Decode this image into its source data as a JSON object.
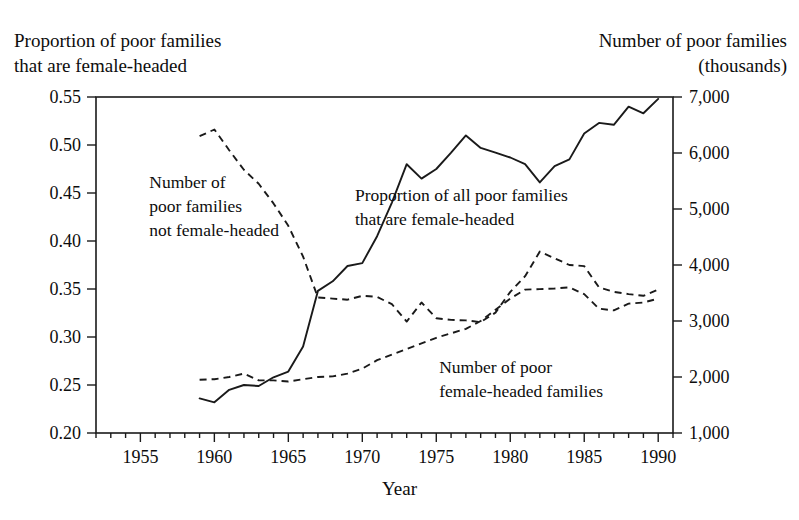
{
  "chart_data": {
    "type": "line",
    "title": "",
    "xlabel": "Year",
    "left_axis": {
      "label": "Proportion of poor families\nthat are female-headed",
      "ticks": [
        "0.55",
        "0.50",
        "0.45",
        "0.40",
        "0.35",
        "0.30",
        "0.25",
        "0.20"
      ],
      "values": [
        0.55,
        0.5,
        0.45,
        0.4,
        0.35,
        0.3,
        0.25,
        0.2
      ],
      "range": [
        0.2,
        0.55
      ]
    },
    "right_axis": {
      "label": "Number of poor families\n(thousands)",
      "ticks": [
        "7,000",
        "6,000",
        "5,000",
        "4,000",
        "3,000",
        "2,000",
        "1,000"
      ],
      "values": [
        7000,
        6000,
        5000,
        4000,
        3000,
        2000,
        1000
      ],
      "range": [
        1000,
        7000
      ]
    },
    "x_axis": {
      "tick_labels": [
        "1955",
        "1960",
        "1965",
        "1970",
        "1975",
        "1980",
        "1985",
        "1990"
      ],
      "tick_values": [
        1955,
        1960,
        1965,
        1970,
        1975,
        1980,
        1985,
        1990
      ],
      "range": [
        1952,
        1991
      ],
      "minor_tick_step": 1
    },
    "grid": false,
    "legend_position": "inline-annotations",
    "annotations": [
      {
        "name": "not-female-headed",
        "text": "Number of\npoor families\nnot female-headed",
        "x": 1955.6,
        "y_left": 0.455
      },
      {
        "name": "proportion-female-headed",
        "text": "Proportion of all poor families\nthat are female-headed",
        "x": 1969.5,
        "y_left": 0.442
      },
      {
        "name": "poor-female-headed-families",
        "text": "Number of poor\nfemale-headed families",
        "x": 1975.2,
        "y_left": 0.263
      }
    ],
    "series": [
      {
        "name": "Proportion of all poor families that are female-headed",
        "axis": "left",
        "style": "solid",
        "x": [
          1959,
          1960,
          1961,
          1962,
          1963,
          1964,
          1965,
          1966,
          1967,
          1968,
          1969,
          1970,
          1971,
          1972,
          1973,
          1974,
          1975,
          1976,
          1977,
          1978,
          1979,
          1980,
          1981,
          1982,
          1983,
          1984,
          1985,
          1986,
          1987,
          1988,
          1989,
          1990
        ],
        "values": [
          0.236,
          0.232,
          0.245,
          0.25,
          0.249,
          0.258,
          0.264,
          0.29,
          0.348,
          0.358,
          0.374,
          0.377,
          0.405,
          0.44,
          0.48,
          0.465,
          0.475,
          0.492,
          0.51,
          0.497,
          0.492,
          0.487,
          0.48,
          0.461,
          0.478,
          0.485,
          0.512,
          0.523,
          0.521,
          0.54,
          0.533,
          0.548
        ]
      },
      {
        "name": "Number of poor families not female-headed",
        "axis": "right",
        "style": "dashed",
        "x": [
          1959,
          1960,
          1961,
          1962,
          1963,
          1964,
          1965,
          1966,
          1967,
          1968,
          1969,
          1970,
          1971,
          1972,
          1973,
          1974,
          1975,
          1976,
          1977,
          1978,
          1979,
          1980,
          1981,
          1982,
          1983,
          1984,
          1985,
          1986,
          1987,
          1988,
          1989,
          1990
        ],
        "values": [
          6300,
          6420,
          6050,
          5700,
          5450,
          5100,
          4700,
          4150,
          3420,
          3400,
          3380,
          3450,
          3430,
          3300,
          2990,
          3330,
          3050,
          3020,
          3010,
          2980,
          3150,
          3520,
          3800,
          4240,
          4120,
          4000,
          3980,
          3600,
          3520,
          3480,
          3450,
          3560
        ]
      },
      {
        "name": "Number of poor female-headed families",
        "axis": "right",
        "style": "dashed",
        "x": [
          1959,
          1960,
          1961,
          1962,
          1963,
          1964,
          1965,
          1966,
          1967,
          1968,
          1969,
          1970,
          1971,
          1972,
          1973,
          1974,
          1975,
          1976,
          1977,
          1978,
          1979,
          1980,
          1981,
          1982,
          1983,
          1984,
          1985,
          1986,
          1987,
          1988,
          1989,
          1990
        ],
        "values": [
          1950,
          1960,
          2000,
          2060,
          1940,
          1940,
          1920,
          1960,
          2000,
          2010,
          2060,
          2150,
          2300,
          2400,
          2500,
          2600,
          2700,
          2780,
          2860,
          3000,
          3200,
          3400,
          3560,
          3570,
          3580,
          3600,
          3480,
          3220,
          3190,
          3310,
          3330,
          3400
        ]
      }
    ]
  }
}
